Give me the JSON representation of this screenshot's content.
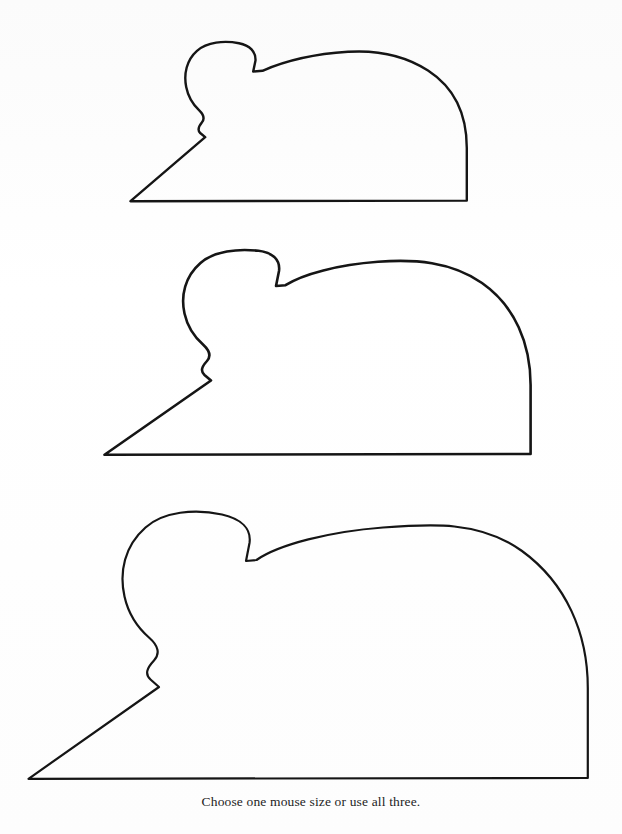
{
  "page": {
    "background_color": "#fdfdfd",
    "ink_color": "#151515",
    "top_cutoff_text": "· ·· ·  · ·",
    "caption": "Choose one mouse size or use all three."
  },
  "patterns": {
    "title": "Mouse pattern templates",
    "count": 3,
    "shapes": [
      {
        "name": "small-mouse-pattern",
        "size_label": "small",
        "stroke_width": 2.4,
        "bounds": {
          "x": 130,
          "y": 44,
          "width": 337,
          "height": 158
        },
        "nose_tip": [
          130,
          201
        ],
        "ear_apex": [
          222,
          45
        ],
        "notch": [
          253,
          71
        ],
        "back_crest": [
          345,
          52
        ],
        "back_bottom": [
          467,
          200
        ],
        "path": "M130.5,201.2 L466.8,200.6 L466.8,148.0 C466.8,116.0 455.0,88.0 428.0,70.5 C404.0,55.0 376.0,50.0 348.0,51.8 C316.0,53.8 286.0,60.5 262.5,70.8 L253.2,71.6 L255.5,60.5 C255.9,52.0 250.0,45.2 239.0,43.2 C224.0,40.4 207.0,42.0 197.0,50.8 C186.5,60.0 183.6,74.0 186.2,87.0 C188.2,97.0 193.0,104.5 199.0,110.2 C203.5,114.5 205.0,118.5 202.0,122.2 C198.6,126.4 197.0,130.0 200.2,133.0 L205.2,137.2 L130.5,201.2 Z"
      },
      {
        "name": "medium-mouse-pattern",
        "size_label": "medium",
        "stroke_width": 2.6,
        "bounds": {
          "x": 104,
          "y": 250,
          "width": 427,
          "height": 205
        },
        "nose_tip": [
          104,
          455
        ],
        "ear_apex": [
          228,
          251
        ],
        "notch": [
          276,
          286
        ],
        "back_crest": [
          378,
          262
        ],
        "back_bottom": [
          531,
          454
        ],
        "path": "M104.5,454.8 L530.6,454.0 L530.6,385.0 C530.6,344.0 515.0,306.0 482.0,283.0 C451.0,261.5 414.0,259.0 378.0,261.8 C338.0,264.8 303.0,274.0 285.5,285.2 L276.0,286.0 L279.0,271.0 C280.4,260.0 273.0,252.5 258.5,250.8 C238.0,248.4 214.0,251.0 200.5,263.0 C185.0,276.5 180.5,295.5 184.5,313.5 C187.5,327.0 194.5,337.0 203.0,344.5 C209.5,350.5 211.5,356.0 207.0,361.0 C202.0,366.5 200.0,371.0 204.5,375.0 L211.0,380.5 L104.5,454.8 Z"
      },
      {
        "name": "large-mouse-pattern",
        "size_label": "large",
        "stroke_width": 2.2,
        "bounds": {
          "x": 28,
          "y": 511,
          "width": 560,
          "height": 268
        },
        "nose_tip": [
          28,
          779
        ],
        "ear_apex": [
          186,
          512
        ],
        "notch": [
          246,
          561
        ],
        "back_crest": [
          383,
          527
        ],
        "back_bottom": [
          588,
          778
        ],
        "path": "M28.5,778.8 L587.8,778.0 L587.8,688.0 C587.8,633.0 566.0,583.0 522.0,551.0 C480.0,520.5 430.0,524.0 383.0,527.5 C330.0,531.5 279.0,544.5 256.5,560.0 L246.0,561.0 L249.5,543.0 C251.5,529.0 241.5,519.0 222.0,514.5 C195.0,508.5 163.0,511.5 145.5,527.5 C124.5,546.0 119.0,572.0 124.5,596.5 C128.5,614.5 138.0,628.0 149.5,638.0 C158.0,645.5 160.5,653.5 154.0,660.5 C147.0,668.0 144.5,674.0 150.5,679.5 L159.0,687.0 L28.5,778.8 Z"
      }
    ]
  }
}
